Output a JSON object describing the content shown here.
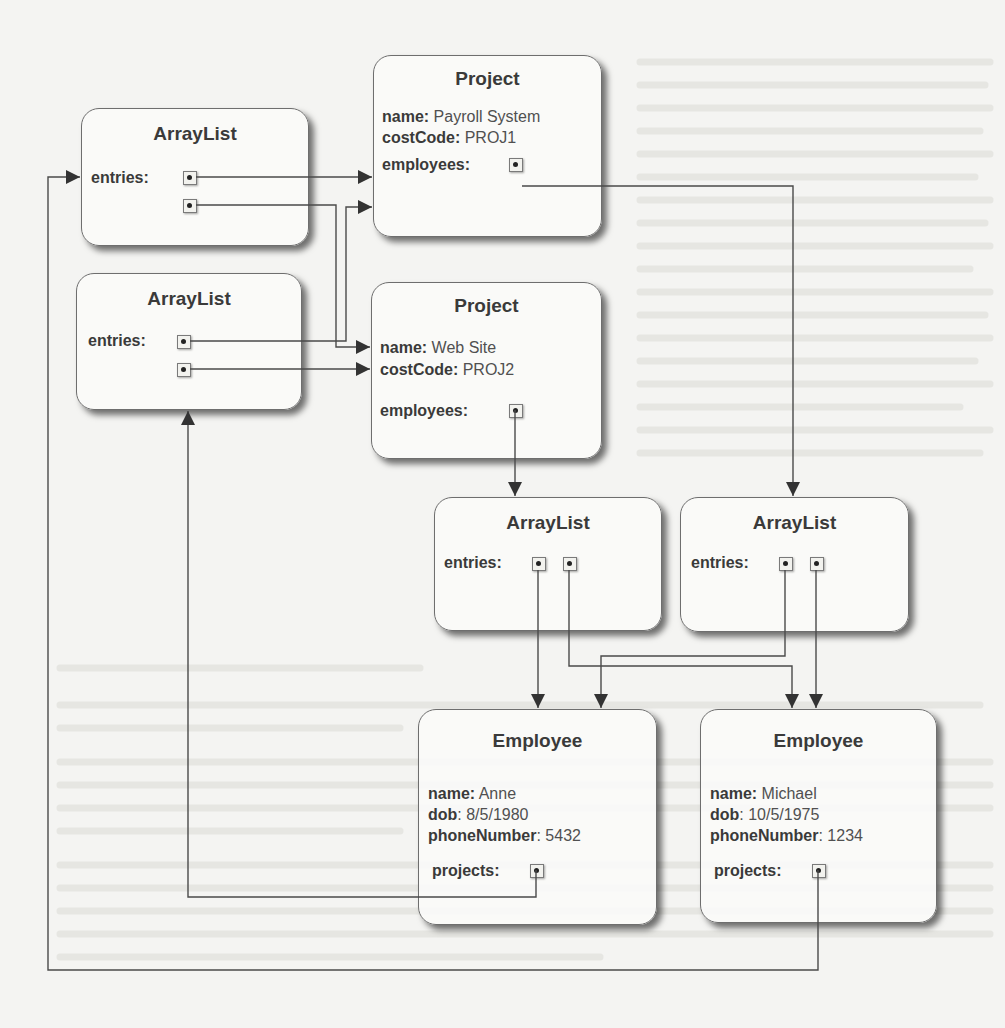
{
  "diagram": {
    "type": "object-reference-diagram",
    "colors": {
      "line": "#4a4a4a",
      "box_border": "#6e6e6e",
      "background": "#f4f4f2"
    },
    "arraylists": [
      {
        "id": "al1",
        "title": "ArrayList",
        "entries_label": "entries:"
      },
      {
        "id": "al2",
        "title": "ArrayList",
        "entries_label": "entries:"
      },
      {
        "id": "al3",
        "title": "ArrayList",
        "entries_label": "entries:"
      },
      {
        "id": "al4",
        "title": "ArrayList",
        "entries_label": "entries:"
      }
    ],
    "projects": [
      {
        "id": "p1",
        "title": "Project",
        "name_label": "name:",
        "name": "Payroll System",
        "costcode_label": "costCode:",
        "costCode": "PROJ1",
        "employees_label": "employees:"
      },
      {
        "id": "p2",
        "title": "Project",
        "name_label": "name:",
        "name": "Web Site",
        "costcode_label": "costCode:",
        "costCode": "PROJ2",
        "employees_label": "employees:"
      }
    ],
    "employees": [
      {
        "id": "e1",
        "title": "Employee",
        "name_label": "name:",
        "name": "Anne",
        "dob_label": "dob",
        "dob": ": 8/5/1980",
        "phone_label": "phoneNumber",
        "phone": ": 5432",
        "projects_label": "projects:"
      },
      {
        "id": "e2",
        "title": "Employee",
        "name_label": "name:",
        "name": "Michael",
        "dob_label": "dob",
        "dob": ": 10/5/1975",
        "phone_label": "phoneNumber",
        "phone": ": 1234",
        "projects_label": "projects:"
      }
    ],
    "edges": [
      {
        "from": "al1.entry0",
        "to": "p1"
      },
      {
        "from": "al1.entry1",
        "to": "p2"
      },
      {
        "from": "al2.entry0",
        "to": "p1"
      },
      {
        "from": "al2.entry1",
        "to": "p2"
      },
      {
        "from": "p1.employees",
        "to": "al4"
      },
      {
        "from": "p2.employees",
        "to": "al3"
      },
      {
        "from": "al3.entry0",
        "to": "e1"
      },
      {
        "from": "al3.entry1",
        "to": "e2"
      },
      {
        "from": "al4.entry0",
        "to": "e1"
      },
      {
        "from": "al4.entry1",
        "to": "e2"
      },
      {
        "from": "e1.projects",
        "to": "al2"
      },
      {
        "from": "e2.projects",
        "to": "al1"
      }
    ]
  }
}
